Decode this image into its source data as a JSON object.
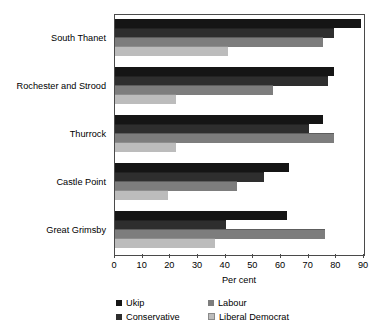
{
  "chart_data": {
    "type": "bar",
    "orientation": "horizontal",
    "title": "",
    "xlabel": "Per cent",
    "ylabel": "",
    "xlim": [
      0,
      90
    ],
    "xticks": [
      0,
      10,
      20,
      30,
      40,
      50,
      60,
      70,
      80,
      90
    ],
    "grid": false,
    "legend_position": "bottom",
    "categories": [
      "South Thanet",
      "Rochester and Strood",
      "Thurrock",
      "Castle Point",
      "Great Grimsby"
    ],
    "series": [
      {
        "name": "Ukip",
        "color": "#151515",
        "values": [
          89,
          79,
          75,
          63,
          62
        ]
      },
      {
        "name": "Conservative",
        "color": "#2e2e2e",
        "values": [
          79,
          77,
          70,
          54,
          40
        ]
      },
      {
        "name": "Labour",
        "color": "#7d7d7d",
        "values": [
          75,
          57,
          79,
          44,
          76
        ]
      },
      {
        "name": "Liberal Democrat",
        "color": "#bcbcbc",
        "values": [
          41,
          22,
          22,
          19,
          36
        ]
      }
    ]
  },
  "axis": {
    "x_title": "Per cent",
    "tick_labels": [
      "0",
      "10",
      "20",
      "30",
      "40",
      "50",
      "60",
      "70",
      "80",
      "90"
    ]
  },
  "legend": {
    "entries": [
      {
        "label": "Ukip",
        "swatch": "ukip"
      },
      {
        "label": "Labour",
        "swatch": "labour"
      },
      {
        "label": "Conservative",
        "swatch": "conservative"
      },
      {
        "label": "Liberal Democrat",
        "swatch": "libdem"
      }
    ]
  }
}
